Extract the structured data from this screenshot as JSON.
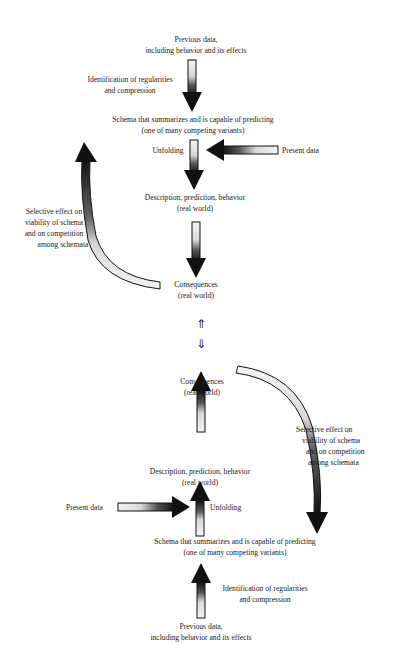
{
  "top_cycle": {
    "previous_data": [
      "Previous data,",
      "including behavior and its effects"
    ],
    "identification": [
      "Identification of regularities",
      "and compression"
    ],
    "schema": [
      "Schema that summarizes and is capable of predicting",
      "(one of many competing variants)"
    ],
    "unfolding": "Unfolding",
    "present_data": "Present data",
    "description": [
      "Description, prediction, behavior",
      "(real world)"
    ],
    "consequences": [
      "Consequences",
      "(real world)"
    ],
    "selective_effect": [
      "Selective effect on",
      "viability of schema",
      "and on competition",
      "among schemata"
    ]
  },
  "connector": {
    "up_arrow": "⇑",
    "down_arrow": "⇓"
  },
  "bottom_cycle": {
    "consequences": [
      "Consequences",
      "(real world)"
    ],
    "selective_effect": [
      "Selective effect on",
      "viability of schema",
      "and on competition",
      "among schemata"
    ],
    "description": [
      "Description, prediction, behavior",
      "(real world)"
    ],
    "present_data": "Present data",
    "unfolding": "Unfolding",
    "schema": [
      "Schema that summarizes and is capable of predicting",
      "(one of many competing variants)"
    ],
    "identification": [
      "Identification of regularities",
      "and compression"
    ],
    "previous_data": [
      "Previous data,",
      "including behavior and its effects"
    ]
  },
  "colors": {
    "arrow_dark": "#111111",
    "arrow_light": "#f2f2f2",
    "background": "#ffffff"
  }
}
